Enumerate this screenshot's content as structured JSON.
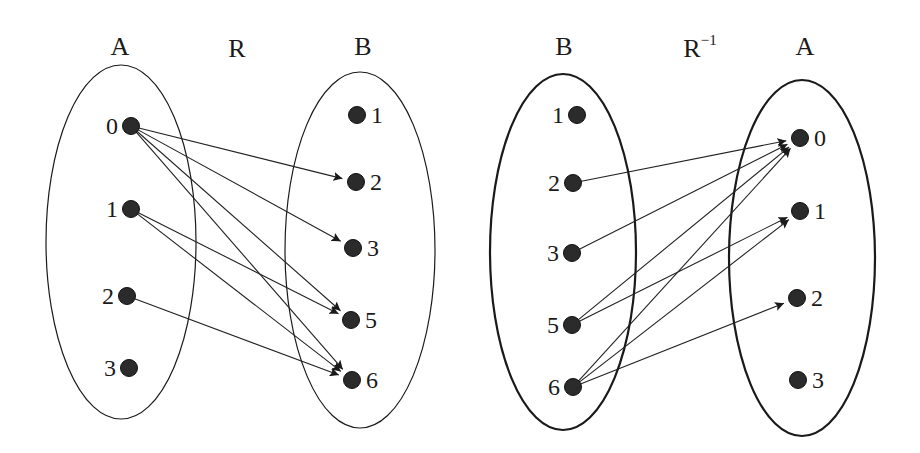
{
  "diagrams": [
    {
      "id": "relation-R",
      "relation_label": "R",
      "relation_superscript": "",
      "domain": {
        "name": "A",
        "elements": [
          "0",
          "1",
          "2",
          "3"
        ]
      },
      "codomain": {
        "name": "B",
        "elements": [
          "1",
          "2",
          "3",
          "5",
          "6"
        ]
      },
      "pairs": [
        [
          "0",
          "2"
        ],
        [
          "0",
          "3"
        ],
        [
          "0",
          "5"
        ],
        [
          "0",
          "6"
        ],
        [
          "1",
          "5"
        ],
        [
          "1",
          "6"
        ],
        [
          "2",
          "6"
        ]
      ]
    },
    {
      "id": "relation-R-inverse",
      "relation_label": "R",
      "relation_superscript": "−1",
      "domain": {
        "name": "B",
        "elements": [
          "1",
          "2",
          "3",
          "5",
          "6"
        ]
      },
      "codomain": {
        "name": "A",
        "elements": [
          "0",
          "1",
          "2",
          "3"
        ]
      },
      "pairs": [
        [
          "2",
          "0"
        ],
        [
          "3",
          "0"
        ],
        [
          "5",
          "0"
        ],
        [
          "5",
          "1"
        ],
        [
          "6",
          "0"
        ],
        [
          "6",
          "1"
        ],
        [
          "6",
          "2"
        ]
      ]
    }
  ]
}
